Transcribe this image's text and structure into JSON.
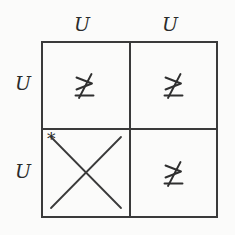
{
  "figure": {
    "type": "matrix-grid",
    "rows": 2,
    "columns": 2,
    "line_color": "#3a3a3a",
    "text_color": "#2b2b2b",
    "background_color": "#fbfbfa"
  },
  "column_headers": [
    {
      "label": "U"
    },
    {
      "label": "U"
    }
  ],
  "row_headers": [
    {
      "label": "U"
    },
    {
      "label": "U"
    }
  ],
  "cells": [
    {
      "row": 0,
      "column": 0,
      "content_kind": "symbol",
      "symbol_name": "not-greater-than-or-equal",
      "symbol": "≱"
    },
    {
      "row": 0,
      "column": 1,
      "content_kind": "symbol",
      "symbol_name": "not-greater-than-or-equal",
      "symbol": "≱"
    },
    {
      "row": 1,
      "column": 0,
      "content_kind": "cross",
      "symbol_name": "diagonal-cross",
      "annotation": "*"
    },
    {
      "row": 1,
      "column": 1,
      "content_kind": "symbol",
      "symbol_name": "not-greater-than-or-equal",
      "symbol": "≱"
    }
  ]
}
